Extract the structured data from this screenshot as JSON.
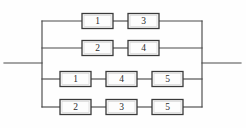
{
  "diagram": {
    "type": "parallel-series-network",
    "background_color": "#fefefe",
    "line_color": "#4a4a4a",
    "box_fill_color": "#fdfdfd",
    "box_border_color": "#3a3a3a",
    "label_color": "#2b2b2b",
    "input_lead": {
      "label": "",
      "x1": 4,
      "x2": 42,
      "y": 63
    },
    "output_lead": {
      "label": "",
      "x1": 202,
      "x2": 241,
      "y": 63
    },
    "left_bus": {
      "x": 42,
      "y1": 21,
      "y2": 107
    },
    "right_bus": {
      "x": 202,
      "y1": 21,
      "y2": 107
    },
    "branches": [
      {
        "name": "branch-1",
        "y": 21,
        "left_x": 42,
        "right_x": 202,
        "blocks": [
          {
            "label": "1",
            "x": 82,
            "width": 31
          },
          {
            "label": "3",
            "x": 128,
            "width": 31
          }
        ]
      },
      {
        "name": "branch-2",
        "y": 48,
        "left_x": 42,
        "right_x": 202,
        "blocks": [
          {
            "label": "2",
            "x": 82,
            "width": 31
          },
          {
            "label": "4",
            "x": 128,
            "width": 31
          }
        ]
      },
      {
        "name": "branch-3",
        "y": 79,
        "left_x": 42,
        "right_x": 202,
        "blocks": [
          {
            "label": "1",
            "x": 60,
            "width": 31
          },
          {
            "label": "4",
            "x": 106,
            "width": 31
          },
          {
            "label": "5",
            "x": 152,
            "width": 31
          }
        ]
      },
      {
        "name": "branch-4",
        "y": 107,
        "left_x": 42,
        "right_x": 202,
        "blocks": [
          {
            "label": "2",
            "x": 60,
            "width": 31
          },
          {
            "label": "3",
            "x": 106,
            "width": 31
          },
          {
            "label": "5",
            "x": 152,
            "width": 31
          }
        ]
      }
    ],
    "block_height": 15
  }
}
